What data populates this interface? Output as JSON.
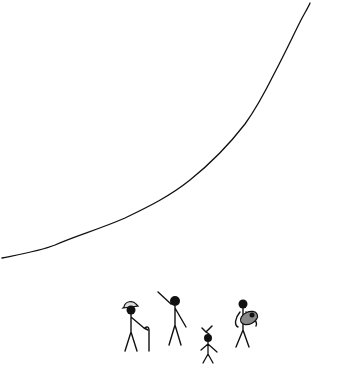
{
  "panel": {
    "background": "#ffffff",
    "ink_color": "#111111",
    "gray_fill": "#888888",
    "light_fill": "#dddddd"
  },
  "curve": {
    "description": "rising exponential-like curve from lower-left to upper-right",
    "points": [
      [
        2,
        258
      ],
      [
        40,
        250
      ],
      [
        70,
        238
      ],
      [
        110,
        224
      ],
      [
        150,
        206
      ],
      [
        185,
        184
      ],
      [
        215,
        158
      ],
      [
        240,
        132
      ],
      [
        258,
        108
      ],
      [
        272,
        84
      ],
      [
        284,
        58
      ],
      [
        296,
        30
      ],
      [
        310,
        3
      ]
    ]
  },
  "figures": [
    {
      "id": "old-man",
      "description": "elderly stick figure with hat and cane"
    },
    {
      "id": "pointing-person",
      "description": "stick figure pointing up at the curve"
    },
    {
      "id": "child",
      "description": "small stick figure with bow on head"
    },
    {
      "id": "parent-with-baby",
      "description": "stick figure holding a bundled baby"
    }
  ]
}
